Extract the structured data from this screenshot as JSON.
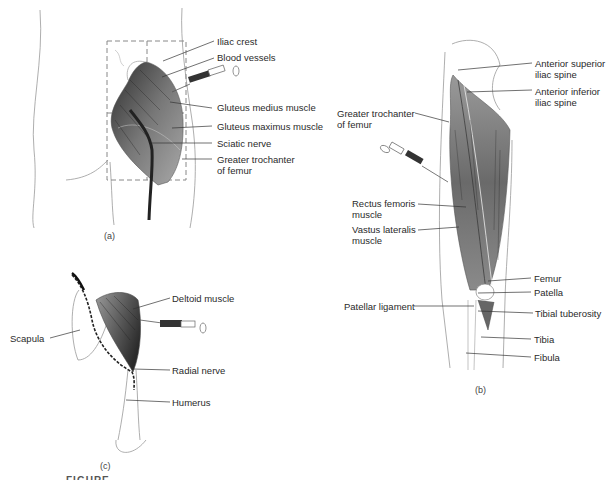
{
  "figure": {
    "caption_partial": "FIGURE",
    "panels": [
      {
        "id": "a",
        "label": "(a)",
        "subject": "Gluteal (dorsogluteal) injection site",
        "labels": [
          "Iliac crest",
          "Blood vessels",
          "Gluteus medius muscle",
          "Gluteus maximus muscle",
          "Sciatic nerve",
          "Greater trochanter of femur"
        ]
      },
      {
        "id": "b",
        "label": "(b)",
        "subject": "Vastus lateralis injection site (thigh)",
        "labels": [
          "Anterior superior iliac spine",
          "Anterior inferior iliac spine",
          "Greater trochanter of femur",
          "Rectus femoris muscle",
          "Vastus lateralis muscle",
          "Femur",
          "Patella",
          "Patellar ligament",
          "Tibial tuberosity",
          "Tibia",
          "Fibula"
        ]
      },
      {
        "id": "c",
        "label": "(c)",
        "subject": "Deltoid injection site (shoulder)",
        "labels": [
          "Deltoid muscle",
          "Scapula",
          "Radial nerve",
          "Humerus"
        ]
      }
    ]
  },
  "colors": {
    "muscle_dark": "#3a3a3a",
    "muscle_mid": "#7d7d7d",
    "muscle_light": "#b8b8b8",
    "outline": "#9a9a9a",
    "leader": "#333333"
  }
}
